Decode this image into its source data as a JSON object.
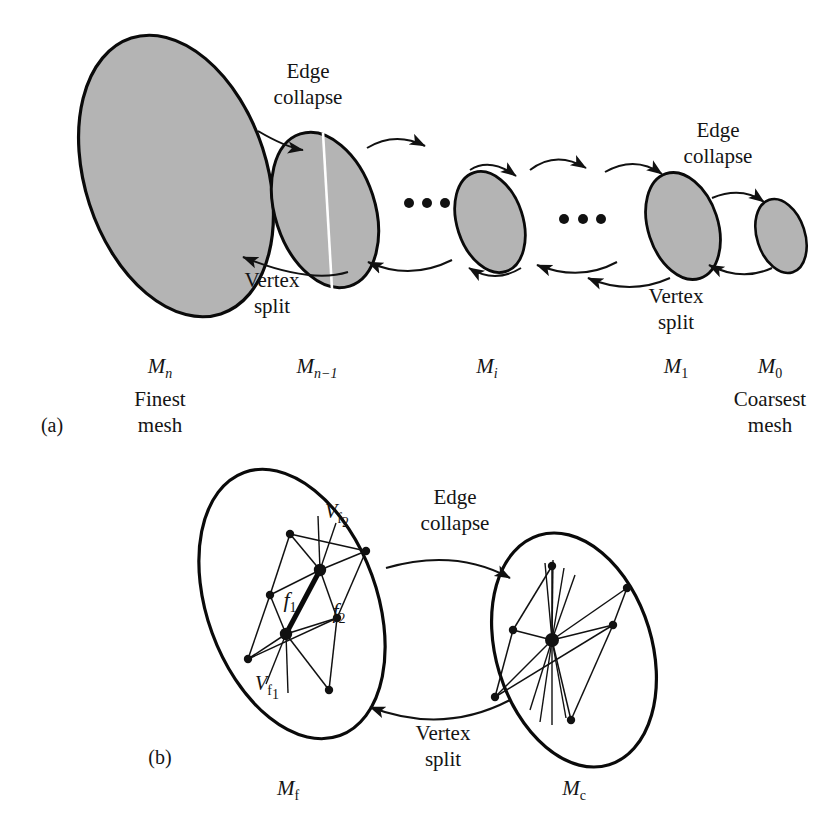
{
  "figure": {
    "background": "#ffffff",
    "ink": "#141414",
    "mesh_fill": "#b4b4b4",
    "mesh_stroke": "#000000"
  },
  "panels": [
    {
      "id": "a",
      "tag": "(a)",
      "operations": [
        {
          "id": "op-a-1",
          "forward": "Edge\ncollapse",
          "forward_line1": "Edge",
          "forward_line2": "collapse",
          "reverse_line1": "Vertex",
          "reverse_line2": "split"
        },
        {
          "id": "op-a-2",
          "forward_line1": "Edge",
          "forward_line2": "collapse",
          "reverse_line1": "Vertex",
          "reverse_line2": "split"
        }
      ],
      "meshes": [
        {
          "id": "mesh-mn",
          "label_base": "M",
          "label_sub": "n",
          "sub_italic": true,
          "caption_line1": "Finest",
          "caption_line2": "mesh"
        },
        {
          "id": "mesh-mn1",
          "label_base": "M",
          "label_sub": "n−1",
          "sub_italic": true,
          "caption_line1": "",
          "caption_line2": ""
        },
        {
          "id": "mesh-mi",
          "label_base": "M",
          "label_sub": "i",
          "sub_italic": true,
          "caption_line1": "",
          "caption_line2": ""
        },
        {
          "id": "mesh-m1",
          "label_base": "M",
          "label_sub": "1",
          "sub_italic": false,
          "caption_line1": "",
          "caption_line2": ""
        },
        {
          "id": "mesh-m0",
          "label_base": "M",
          "label_sub": "0",
          "sub_italic": false,
          "caption_line1": "Coarsest",
          "caption_line2": "mesh"
        }
      ],
      "ellipsis": [
        "• • •",
        "• • •"
      ]
    },
    {
      "id": "b",
      "tag": "(b)",
      "operation": {
        "forward_line1": "Edge",
        "forward_line2": "collapse",
        "reverse_line1": "Vertex",
        "reverse_line2": "split"
      },
      "meshes": [
        {
          "id": "mesh-mf",
          "label_base": "M",
          "label_sub": "f",
          "sub_italic": false
        },
        {
          "id": "mesh-mc",
          "label_base": "M",
          "label_sub": "c",
          "sub_italic": false
        }
      ],
      "face_labels": [
        {
          "id": "face-f1",
          "base": "f",
          "sub": "1"
        },
        {
          "id": "face-f2",
          "base": "f",
          "sub": "2"
        }
      ],
      "vertex_labels": [
        {
          "id": "vertex-vf1",
          "base": "V",
          "sub": "f",
          "subsub": "1"
        },
        {
          "id": "vertex-vf2",
          "base": "V",
          "sub": "f",
          "subsub": "2"
        }
      ]
    }
  ]
}
